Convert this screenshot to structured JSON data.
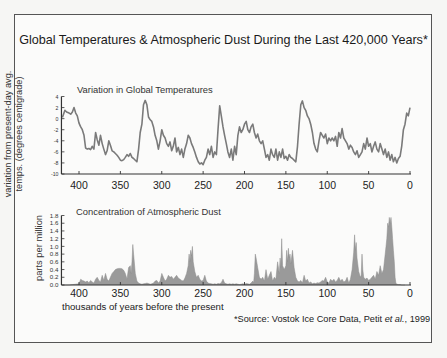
{
  "title": "Global Temperatures & Atmospheric Dust During the Last 420,000 Years*",
  "source": {
    "prefix": "*Source: Vostok Ice Core Data, Petit ",
    "italic": "et al.",
    "suffix": ", 1999"
  },
  "colors": {
    "line": "#7a7a7a",
    "fill": "#9a9a9a",
    "axis": "#333333",
    "frame": "#555555"
  },
  "chart_data": [
    {
      "type": "line",
      "title": "Variation in Global Temperatures",
      "xlabel": "thousands of years before the present",
      "ylabel": "variation from present-day avg. temps. (degrees centigrade)",
      "ylabel_lines": [
        "variation from present-day avg.",
        "temps. (degrees centigrade)"
      ],
      "x_reversed": true,
      "xlim": [
        420,
        0
      ],
      "ylim": [
        -10,
        4
      ],
      "x_ticks": [
        400,
        350,
        300,
        250,
        200,
        150,
        100,
        50,
        0
      ],
      "y_ticks": [
        4,
        2,
        0,
        -2,
        -4,
        -6,
        -8,
        -10
      ],
      "grid": false,
      "series": [
        {
          "name": "Temperature variation",
          "x": [
            420,
            417,
            415,
            412,
            410,
            408,
            406,
            404,
            402,
            400,
            398,
            396,
            394,
            392,
            390,
            388,
            386,
            384,
            382,
            380,
            378,
            376,
            374,
            372,
            370,
            368,
            366,
            364,
            362,
            360,
            358,
            356,
            354,
            352,
            350,
            348,
            346,
            344,
            342,
            340,
            338,
            336,
            334,
            332,
            330,
            328,
            326,
            324,
            322,
            320,
            318,
            316,
            314,
            312,
            310,
            308,
            306,
            304,
            302,
            300,
            298,
            296,
            294,
            292,
            290,
            288,
            286,
            284,
            282,
            280,
            278,
            276,
            274,
            272,
            270,
            268,
            266,
            264,
            262,
            260,
            258,
            256,
            254,
            252,
            250,
            248,
            246,
            244,
            242,
            240,
            238,
            236,
            234,
            232,
            230,
            228,
            226,
            224,
            222,
            220,
            218,
            216,
            214,
            212,
            210,
            208,
            206,
            204,
            202,
            200,
            198,
            196,
            194,
            192,
            190,
            188,
            186,
            184,
            182,
            180,
            178,
            176,
            174,
            172,
            170,
            168,
            166,
            164,
            162,
            160,
            158,
            156,
            154,
            152,
            150,
            148,
            146,
            144,
            142,
            140,
            138,
            136,
            134,
            132,
            130,
            128,
            126,
            124,
            122,
            120,
            118,
            116,
            114,
            112,
            110,
            108,
            106,
            104,
            102,
            100,
            98,
            96,
            94,
            92,
            90,
            88,
            86,
            84,
            82,
            80,
            78,
            76,
            74,
            72,
            70,
            68,
            66,
            64,
            62,
            60,
            58,
            56,
            54,
            52,
            50,
            48,
            46,
            44,
            42,
            40,
            38,
            36,
            34,
            32,
            30,
            28,
            26,
            24,
            22,
            20,
            18,
            16,
            14,
            12,
            10,
            8,
            6,
            4,
            2,
            0
          ],
          "y": [
            0.2,
            1.5,
            1.2,
            1.0,
            0.8,
            1.2,
            2.0,
            1.0,
            0.5,
            -0.8,
            -1.5,
            -2.0,
            -3.0,
            -5.3,
            -5.5,
            -5.4,
            -5.6,
            -5.0,
            -5.5,
            -2.5,
            -3.8,
            -4.8,
            -3.0,
            -4.5,
            -5.5,
            -6.5,
            -5.8,
            -4.0,
            -4.8,
            -5.8,
            -6.0,
            -6.3,
            -6.6,
            -7.0,
            -7.5,
            -7.6,
            -7.4,
            -7.0,
            -6.5,
            -6.8,
            -6.3,
            -7.0,
            -7.2,
            -7.5,
            -7.8,
            -5.5,
            -2.5,
            -1.0,
            2.5,
            3.3,
            2.5,
            0.3,
            -0.2,
            -0.5,
            -1.5,
            -3.0,
            -4.0,
            -5.5,
            -4.0,
            -2.0,
            -3.0,
            -3.5,
            -4.5,
            -5.0,
            -4.2,
            -5.8,
            -5.0,
            -3.5,
            -6.0,
            -5.2,
            -6.5,
            -5.5,
            -7.0,
            -5.5,
            -4.5,
            -3.0,
            -3.5,
            -4.5,
            -5.2,
            -6.0,
            -7.0,
            -7.8,
            -8.2,
            -8.0,
            -8.3,
            -7.5,
            -7.0,
            -5.5,
            -6.5,
            -5.0,
            -7.0,
            -6.0,
            -6.5,
            -2.0,
            2.3,
            0.5,
            -1.5,
            -3.0,
            -4.5,
            -6.0,
            -7.0,
            -5.5,
            -7.5,
            -5.0,
            -6.5,
            -3.0,
            -1.5,
            -2.5,
            -2.0,
            -1.0,
            -0.5,
            -2.0,
            -2.5,
            -1.5,
            -1.0,
            -2.5,
            -3.5,
            -2.8,
            -4.0,
            -4.5,
            -4.0,
            -5.5,
            -7.0,
            -6.5,
            -7.5,
            -5.5,
            -6.5,
            -7.0,
            -5.5,
            -7.5,
            -6.0,
            -7.0,
            -5.5,
            -7.2,
            -6.8,
            -7.5,
            -6.5,
            -7.0,
            -7.2,
            -7.5,
            -7.8,
            -5.0,
            -1.0,
            2.5,
            3.2,
            2.0,
            1.5,
            0.5,
            0.0,
            -1.0,
            -2.5,
            -4.5,
            -5.5,
            -6.0,
            -4.0,
            -2.5,
            -3.0,
            -3.5,
            -2.8,
            -4.5,
            -3.5,
            -4.0,
            -3.5,
            -4.0,
            -3.2,
            -5.0,
            -2.5,
            -3.5,
            -1.8,
            -3.5,
            -4.0,
            -4.5,
            -5.5,
            -4.8,
            -5.2,
            -6.0,
            -6.5,
            -5.8,
            -7.0,
            -6.5,
            -6.0,
            -4.5,
            -5.5,
            -3.5,
            -5.0,
            -4.5,
            -6.0,
            -5.0,
            -4.2,
            -5.5,
            -6.0,
            -4.5,
            -5.5,
            -6.5,
            -5.5,
            -7.0,
            -6.0,
            -7.5,
            -6.5,
            -7.8,
            -7.0,
            -8.0,
            -7.2,
            -6.8,
            -5.0,
            -2.0,
            -1.0,
            1.0,
            0.5,
            2.0,
            0.5,
            1.5,
            0.0,
            1.0,
            1.2
          ]
        }
      ]
    },
    {
      "type": "area",
      "title": "Concentration of Atmospheric Dust",
      "xlabel": "thousands of years before the present",
      "ylabel": "parts per million",
      "x_reversed": true,
      "xlim": [
        420,
        0
      ],
      "ylim": [
        0,
        1.8
      ],
      "x_ticks": [
        400,
        350,
        300,
        250,
        200,
        150,
        100,
        50,
        0
      ],
      "y_ticks": [
        1.8,
        1.6,
        1.4,
        1.2,
        1.0,
        0.8,
        0.6,
        0.4,
        0.2,
        0.0
      ],
      "y_tick_labels": [
        "1.8",
        "1.6",
        "1.4",
        "1.2",
        "1.0",
        "0.8",
        "0.6",
        "0.4",
        "0.2",
        "0.0"
      ],
      "grid": false,
      "series": [
        {
          "name": "Dust concentration (ppm)",
          "x": [
            420,
            416,
            412,
            408,
            404,
            400,
            398,
            396,
            394,
            392,
            390,
            388,
            386,
            384,
            382,
            380,
            378,
            376,
            374,
            372,
            370,
            368,
            366,
            364,
            362,
            360,
            358,
            356,
            354,
            352,
            350,
            348,
            346,
            344,
            342,
            340,
            338,
            337,
            336,
            335,
            334,
            332,
            330,
            328,
            326,
            324,
            322,
            320,
            318,
            316,
            314,
            312,
            310,
            308,
            306,
            304,
            302,
            300,
            298,
            296,
            294,
            292,
            290,
            288,
            286,
            284,
            282,
            280,
            278,
            276,
            274,
            272,
            270,
            268,
            267,
            266,
            265,
            264,
            263,
            262,
            260,
            258,
            256,
            254,
            252,
            250,
            248,
            246,
            244,
            242,
            240,
            238,
            236,
            234,
            232,
            230,
            228,
            226,
            224,
            222,
            220,
            218,
            216,
            214,
            212,
            210,
            208,
            206,
            204,
            202,
            200,
            198,
            196,
            194,
            192,
            190,
            189,
            188,
            187,
            186,
            184,
            182,
            180,
            178,
            176,
            174,
            172,
            170,
            168,
            166,
            164,
            162,
            160,
            158,
            157,
            156,
            155,
            154,
            152,
            150,
            149,
            148,
            147,
            146,
            145,
            144,
            142,
            140,
            138,
            136,
            134,
            132,
            130,
            128,
            126,
            124,
            122,
            120,
            118,
            116,
            114,
            112,
            110,
            108,
            106,
            104,
            102,
            100,
            98,
            96,
            94,
            92,
            90,
            88,
            86,
            84,
            82,
            80,
            78,
            76,
            74,
            72,
            70,
            68,
            67,
            66,
            65,
            64,
            62,
            60,
            59,
            58,
            57,
            56,
            54,
            52,
            50,
            48,
            46,
            44,
            42,
            40,
            38,
            36,
            34,
            32,
            30,
            29,
            28,
            27,
            26,
            25,
            24,
            23,
            22,
            21,
            20,
            19,
            18,
            17,
            16,
            14,
            12,
            10,
            8,
            6,
            4,
            2,
            0
          ],
          "y": [
            0.0,
            0.0,
            0.0,
            0.01,
            0.02,
            0.03,
            0.15,
            0.12,
            0.1,
            0.08,
            0.1,
            0.06,
            0.12,
            0.08,
            0.05,
            0.15,
            0.2,
            0.12,
            0.08,
            0.25,
            0.12,
            0.3,
            0.15,
            0.1,
            0.2,
            0.3,
            0.35,
            0.4,
            0.42,
            0.43,
            0.43,
            0.42,
            0.38,
            0.3,
            0.15,
            0.45,
            0.5,
            0.3,
            0.6,
            1.05,
            0.8,
            0.3,
            0.1,
            0.05,
            0.03,
            0.02,
            0.03,
            0.04,
            0.05,
            0.04,
            0.02,
            0.03,
            0.05,
            0.1,
            0.12,
            0.05,
            0.1,
            0.3,
            0.2,
            0.1,
            0.15,
            0.25,
            0.2,
            0.22,
            0.15,
            0.2,
            0.25,
            0.18,
            0.15,
            0.12,
            0.1,
            0.18,
            0.3,
            0.5,
            0.8,
            0.6,
            0.9,
            0.75,
            1.0,
            0.6,
            0.35,
            0.2,
            0.25,
            0.15,
            0.1,
            0.12,
            0.25,
            0.1,
            0.05,
            0.04,
            0.03,
            0.02,
            0.03,
            0.02,
            0.04,
            0.03,
            0.06,
            0.15,
            0.05,
            0.03,
            0.02,
            0.03,
            0.02,
            0.03,
            0.02,
            0.03,
            0.02,
            0.01,
            0.02,
            0.03,
            0.02,
            0.04,
            0.03,
            0.02,
            0.05,
            0.1,
            0.05,
            0.3,
            0.8,
            0.7,
            0.45,
            0.2,
            0.15,
            0.2,
            0.1,
            0.4,
            0.15,
            0.25,
            0.35,
            0.1,
            0.2,
            0.15,
            0.6,
            0.3,
            0.7,
            0.45,
            1.2,
            0.5,
            0.4,
            0.5,
            0.9,
            0.6,
            0.95,
            0.7,
            0.8,
            0.55,
            0.9,
            0.45,
            0.2,
            0.1,
            0.08,
            0.12,
            0.05,
            0.25,
            0.1,
            0.15,
            0.05,
            0.08,
            0.03,
            0.05,
            0.04,
            0.06,
            0.05,
            0.08,
            0.12,
            0.1,
            0.2,
            0.08,
            0.05,
            0.15,
            0.1,
            0.15,
            0.08,
            0.12,
            0.2,
            0.1,
            0.15,
            0.08,
            0.1,
            0.2,
            0.05,
            0.15,
            0.4,
            0.85,
            1.3,
            0.9,
            1.1,
            0.7,
            0.35,
            0.2,
            0.25,
            0.8,
            0.4,
            0.2,
            0.15,
            0.18,
            0.12,
            0.15,
            0.2,
            0.25,
            0.15,
            0.35,
            0.25,
            0.5,
            0.3,
            0.4,
            0.8,
            1.0,
            1.2,
            1.6,
            1.5,
            1.75,
            1.6,
            1.75,
            1.5,
            1.2,
            0.9,
            0.6,
            0.2,
            0.05,
            0.02,
            0.01,
            0.01,
            0.0,
            0.0,
            0.0
          ]
        }
      ]
    }
  ],
  "top_chart": {
    "subtitle": "Variation in Global Temperatures",
    "ylabel_line1": "variation from present-day avg.",
    "ylabel_line2": "temps. (degrees centigrade)"
  },
  "bottom_chart": {
    "subtitle": "Concentration of Atmospheric Dust",
    "ylabel": "parts per million",
    "xlabel": "thousands of years before the present"
  }
}
